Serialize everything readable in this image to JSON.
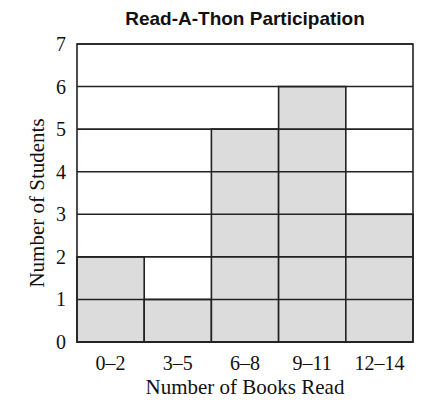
{
  "chart_data": {
    "type": "bar",
    "title": "Read-A-Thon Participation",
    "xlabel": "Number of Books Read",
    "ylabel": "Number of Students",
    "categories": [
      "0–2",
      "3–5",
      "6–8",
      "9–11",
      "12–14"
    ],
    "values": [
      2,
      1,
      5,
      6,
      3
    ],
    "ylim": [
      0,
      7
    ],
    "yticks": [
      0,
      1,
      2,
      3,
      4,
      5,
      6,
      7
    ],
    "grid": true,
    "legend": null,
    "colors": {
      "bar_fill": "#dcdcdc",
      "grid": "#222222",
      "background": "#ffffff"
    }
  }
}
